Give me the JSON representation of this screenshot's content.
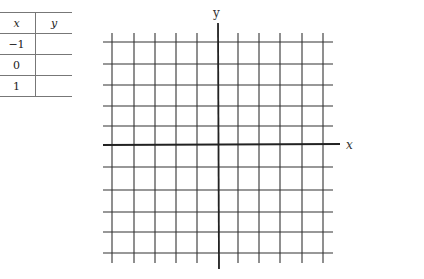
{
  "table": {
    "headers": [
      "x",
      "y"
    ],
    "rows": [
      {
        "x": "−1",
        "y": ""
      },
      {
        "x": "0",
        "y": ""
      },
      {
        "x": "1",
        "y": ""
      }
    ]
  },
  "graph": {
    "x_axis_label": "x",
    "y_axis_label": "y",
    "grid_color": "#333333",
    "axis_color": "#222222",
    "vertical_lines_x": [
      112,
      134,
      155,
      176,
      197,
      238,
      259,
      280,
      302,
      323
    ],
    "horizontal_lines_y": [
      42,
      64,
      85,
      106,
      126,
      167,
      190,
      212,
      232,
      253
    ],
    "x_axis_y": 145,
    "y_axis_x": 218
  }
}
